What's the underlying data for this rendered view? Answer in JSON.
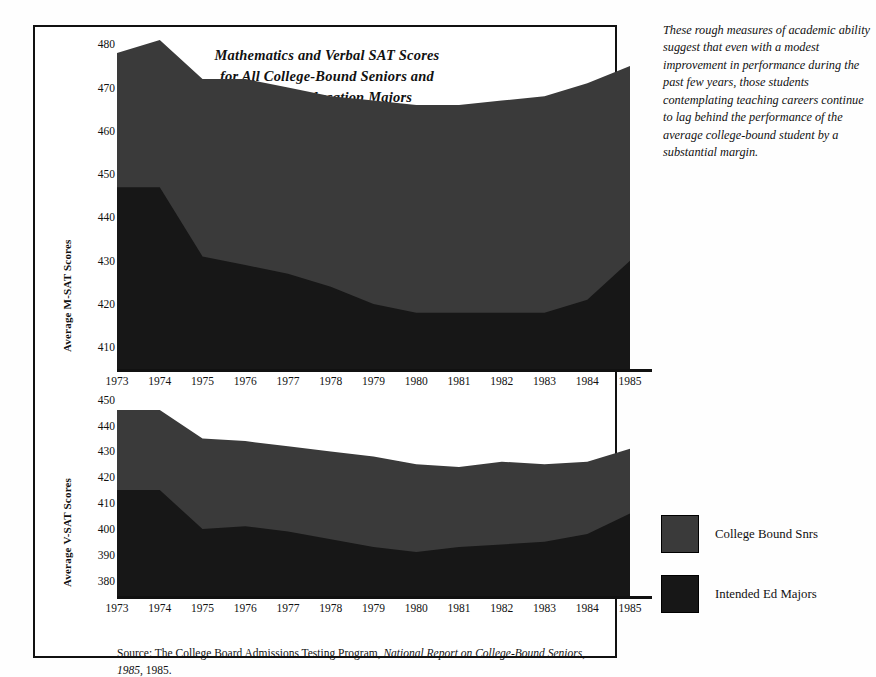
{
  "figure": {
    "title_lines": [
      "Mathematics and Verbal SAT Scores",
      "for All College-Bound Seniors and",
      "Intended Education Majors"
    ],
    "source_prefix": "Source: The College Board Admissions Testing Program, ",
    "source_italic": "National Report on College-Bound Seniors, 1985,",
    "source_suffix": " 1985."
  },
  "caption": {
    "text": "These rough measures of academic ability suggest that even with a modest improvement in performance during the past few years, those students contemplating teaching careers continue to lag behind the performance of the average college-bound student by a substantial margin."
  },
  "legend": {
    "position": "right",
    "items": [
      {
        "label": "College Bound Snrs",
        "color": "#3a3a3a"
      },
      {
        "label": "Intended Ed Majors",
        "color": "#171717"
      }
    ]
  },
  "colors": {
    "college_bound": "#3a3a3a",
    "intended_ed": "#171717",
    "frame": "#111111",
    "background": "#ffffff"
  },
  "chart_data": [
    {
      "id": "msat",
      "type": "area",
      "stacked": false,
      "title": "Mathematics and Verbal SAT Scores for All College-Bound Seniors and Intended Education Majors",
      "xlabel": "",
      "ylabel": "Average M-SAT Scores",
      "x": [
        1973,
        1974,
        1975,
        1976,
        1977,
        1978,
        1979,
        1980,
        1981,
        1982,
        1983,
        1984,
        1985
      ],
      "categories": [
        "1973",
        "1974",
        "1975",
        "1976",
        "1977",
        "1978",
        "1979",
        "1980",
        "1981",
        "1982",
        "1983",
        "1984",
        "1985"
      ],
      "yticks": [
        410,
        420,
        430,
        440,
        450,
        460,
        470,
        480
      ],
      "ylim": [
        405,
        484
      ],
      "grid": false,
      "series": [
        {
          "name": "College Bound Snrs",
          "color": "#3a3a3a",
          "values": [
            478,
            481,
            472,
            472,
            470,
            468,
            467,
            466,
            466,
            467,
            468,
            471,
            475
          ]
        },
        {
          "name": "Intended Ed Majors",
          "color": "#171717",
          "values": [
            447,
            447,
            431,
            429,
            427,
            424,
            420,
            418,
            418,
            418,
            418,
            421,
            430
          ]
        }
      ]
    },
    {
      "id": "vsat",
      "type": "area",
      "stacked": false,
      "title": "",
      "xlabel": "",
      "ylabel": "Average V-SAT Scores",
      "x": [
        1973,
        1974,
        1975,
        1976,
        1977,
        1978,
        1979,
        1980,
        1981,
        1982,
        1983,
        1984,
        1985
      ],
      "categories": [
        "1973",
        "1974",
        "1975",
        "1976",
        "1977",
        "1978",
        "1979",
        "1980",
        "1981",
        "1982",
        "1983",
        "1984",
        "1985"
      ],
      "yticks": [
        380,
        390,
        400,
        410,
        420,
        430,
        440,
        450
      ],
      "ylim": [
        374,
        453
      ],
      "grid": false,
      "series": [
        {
          "name": "College Bound Snrs",
          "color": "#3a3a3a",
          "values": [
            446,
            446,
            435,
            434,
            432,
            430,
            428,
            425,
            424,
            426,
            425,
            426,
            431
          ]
        },
        {
          "name": "Intended Ed Majors",
          "color": "#171717",
          "values": [
            415,
            415,
            400,
            401,
            399,
            396,
            393,
            391,
            393,
            394,
            395,
            398,
            406
          ]
        }
      ]
    }
  ]
}
